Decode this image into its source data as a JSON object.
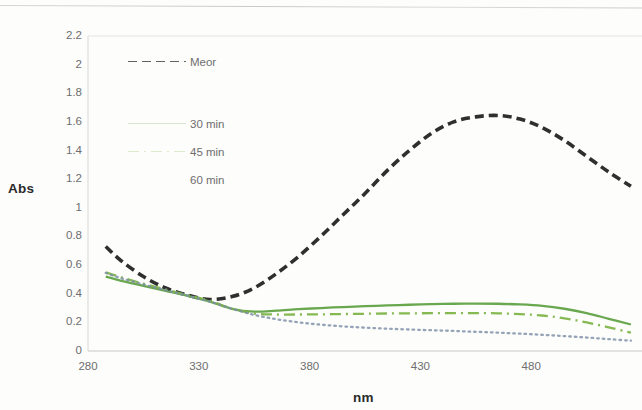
{
  "axes": {
    "y_title": "Abs",
    "x_title": "nm",
    "y_ticks": [
      "2.2",
      "2",
      "1.8",
      "1.6",
      "1.4",
      "1.2",
      "1",
      "0.8",
      "0.6",
      "0.4",
      "0.2",
      "0"
    ],
    "x_ticks": [
      "280",
      "330",
      "380",
      "430",
      "480"
    ]
  },
  "legend": {
    "items": [
      {
        "label": "Meor",
        "color": "#2f2f2f",
        "style": "dashed"
      },
      {
        "label": "30 min",
        "color": "#6aa84f",
        "style": "solid"
      },
      {
        "label": "45 min",
        "color": "#7cb342",
        "style": "dash-dot"
      },
      {
        "label": "60 min",
        "color": "#7d8fa6",
        "style": "dotted"
      }
    ]
  },
  "chart_data": {
    "type": "line",
    "title": "",
    "xlabel": "nm",
    "ylabel": "Abs",
    "xlim": [
      280,
      530
    ],
    "ylim": [
      0,
      2.2
    ],
    "ytick_step": 0.2,
    "xtick_step": 50,
    "grid": false,
    "legend_position": "inside-upper-left",
    "x": [
      288,
      295,
      305,
      315,
      325,
      335,
      345,
      355,
      365,
      375,
      385,
      395,
      405,
      415,
      425,
      435,
      445,
      455,
      465,
      475,
      485,
      495,
      505,
      515,
      525
    ],
    "series": [
      {
        "name": "Meor",
        "color": "#2f2f2f",
        "style": "dashed",
        "values": [
          0.73,
          0.63,
          0.52,
          0.44,
          0.39,
          0.36,
          0.38,
          0.44,
          0.54,
          0.66,
          0.8,
          0.95,
          1.1,
          1.26,
          1.4,
          1.52,
          1.6,
          1.635,
          1.645,
          1.62,
          1.56,
          1.47,
          1.36,
          1.25,
          1.15
        ]
      },
      {
        "name": "30 min",
        "color": "#6aa84f",
        "style": "solid",
        "values": [
          0.52,
          0.49,
          0.455,
          0.42,
          0.385,
          0.345,
          0.295,
          0.275,
          0.282,
          0.292,
          0.3,
          0.307,
          0.313,
          0.318,
          0.323,
          0.327,
          0.33,
          0.331,
          0.33,
          0.325,
          0.315,
          0.295,
          0.265,
          0.225,
          0.185
        ]
      },
      {
        "name": "45 min",
        "color": "#7cb342",
        "style": "dash-dot",
        "values": [
          0.55,
          0.515,
          0.47,
          0.43,
          0.39,
          0.35,
          0.295,
          0.262,
          0.255,
          0.255,
          0.256,
          0.258,
          0.26,
          0.262,
          0.263,
          0.264,
          0.265,
          0.265,
          0.263,
          0.258,
          0.248,
          0.228,
          0.2,
          0.165,
          0.128
        ]
      },
      {
        "name": "60 min",
        "color": "#7d8fa6",
        "style": "dotted",
        "values": [
          0.545,
          0.508,
          0.465,
          0.425,
          0.386,
          0.345,
          0.295,
          0.252,
          0.222,
          0.2,
          0.184,
          0.172,
          0.163,
          0.156,
          0.15,
          0.145,
          0.14,
          0.134,
          0.128,
          0.121,
          0.113,
          0.104,
          0.094,
          0.083,
          0.072
        ]
      }
    ]
  }
}
